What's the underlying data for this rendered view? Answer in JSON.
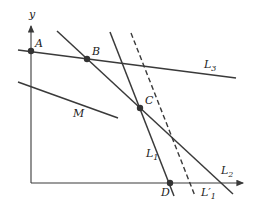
{
  "diagram": {
    "axes": {
      "y_label": "y",
      "x_axis_y": 183,
      "y_axis_x": 31
    },
    "lines": [
      {
        "name": "L3",
        "label_main": "L",
        "label_sub": "3",
        "style": "solid",
        "from": [
          18,
          50
        ],
        "to": [
          236,
          78
        ]
      },
      {
        "name": "L2",
        "label_main": "L",
        "label_sub": "2",
        "style": "solid",
        "from": [
          57,
          31
        ],
        "to": [
          233,
          194
        ]
      },
      {
        "name": "L1",
        "label_main": "L",
        "label_sub": "1",
        "style": "solid",
        "from": [
          110,
          32
        ],
        "to": [
          174,
          196
        ]
      },
      {
        "name": "L'1",
        "label_main": "L′",
        "label_sub": "1",
        "style": "dashed",
        "from": [
          131,
          33
        ],
        "to": [
          195,
          196
        ]
      },
      {
        "name": "M",
        "label_main": "M",
        "label_sub": "",
        "style": "solid",
        "from": [
          18,
          82
        ],
        "to": [
          118,
          118
        ]
      }
    ],
    "points": [
      {
        "name": "A",
        "label": "A",
        "at": [
          31,
          51
        ]
      },
      {
        "name": "B",
        "label": "B",
        "at": [
          87,
          59
        ]
      },
      {
        "name": "C",
        "label": "C",
        "at": [
          140,
          108
        ]
      },
      {
        "name": "D",
        "label": "D",
        "at": [
          170,
          183
        ]
      }
    ],
    "colors": {
      "line": "#3a3a3a",
      "background": "#ffffff"
    }
  }
}
